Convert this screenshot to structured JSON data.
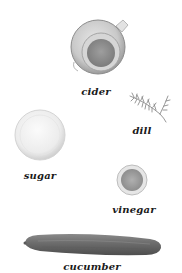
{
  "diagram": {
    "type": "ingredient-illustration",
    "background": "#ffffff",
    "items": [
      {
        "id": "cider",
        "label": "cider",
        "depiction": "glass measuring cup with amber liquid",
        "tone": "#b8b8b8"
      },
      {
        "id": "dill",
        "label": "dill",
        "depiction": "sprig of fresh dill",
        "tone": "#8a8a8a"
      },
      {
        "id": "sugar",
        "label": "sugar",
        "depiction": "bowl of white sugar",
        "tone": "#ededed"
      },
      {
        "id": "vinegar",
        "label": "vinegar",
        "depiction": "small bowl of vinegar",
        "tone": "#c4c4c4"
      },
      {
        "id": "cucumber",
        "label": "cucumber",
        "depiction": "whole long cucumber",
        "tone": "#6e6e6e"
      }
    ]
  }
}
